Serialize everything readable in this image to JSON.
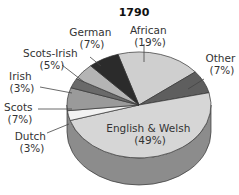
{
  "chart_data": {
    "type": "pie",
    "title": "1790",
    "start_angle_deg": -17,
    "slices": [
      {
        "label": "African",
        "value": 19,
        "pct_text": "(19%)",
        "color": "#cfcfcf"
      },
      {
        "label": "Other",
        "value": 7,
        "pct_text": "(7%)",
        "color": "#5e5e5e"
      },
      {
        "label": "English & Welsh",
        "value": 49,
        "pct_text": "(49%)",
        "color": "#d6d6d6"
      },
      {
        "label": "Dutch",
        "value": 3,
        "pct_text": "(3%)",
        "color": "#f2f2f2"
      },
      {
        "label": "Scots",
        "value": 7,
        "pct_text": "(7%)",
        "color": "#9a9a9a"
      },
      {
        "label": "Irish",
        "value": 3,
        "pct_text": "(3%)",
        "color": "#6a6a6a"
      },
      {
        "label": "Scots-Irish",
        "value": 5,
        "pct_text": "(5%)",
        "color": "#b4b4b4"
      },
      {
        "label": "German",
        "value": 7,
        "pct_text": "(7%)",
        "color": "#2b2b2b"
      }
    ],
    "legend": "none (direct labels)",
    "style": "3d-tilted"
  },
  "labels": {
    "african": {
      "name": "African",
      "pct": "(19%)"
    },
    "other": {
      "name": "Other",
      "pct": "(7%)"
    },
    "english": {
      "name": "English & Welsh",
      "pct": "(49%)"
    },
    "dutch": {
      "name": "Dutch",
      "pct": "(3%)"
    },
    "scots": {
      "name": "Scots",
      "pct": "(7%)"
    },
    "irish": {
      "name": "Irish",
      "pct": "(3%)"
    },
    "scotsirish": {
      "name": "Scots-Irish",
      "pct": "(5%)"
    },
    "german": {
      "name": "German",
      "pct": "(7%)"
    }
  },
  "colors": {
    "side": "#8c8c8c",
    "outline": "#333333",
    "leader": "#444444"
  }
}
